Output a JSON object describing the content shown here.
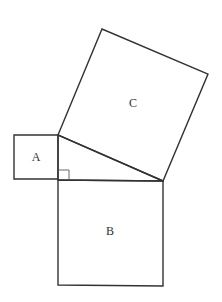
{
  "diagram": {
    "labels": {
      "A": "A",
      "B": "B",
      "C": "C"
    },
    "stroke_color": "#333333",
    "background": "#ffffff",
    "shapes": {
      "square_A": {
        "points": "14,135 58,135 58,179 14,179"
      },
      "square_B": {
        "points": "58,180 163,181 163,286 58,285"
      },
      "square_C": {
        "points": "58,135 102,29 208,74 163,181"
      },
      "triangle": {
        "points": "58,135 58,180 163,181"
      },
      "right_angle_marker": {
        "points": "58,170 69,170 69,180"
      }
    }
  }
}
